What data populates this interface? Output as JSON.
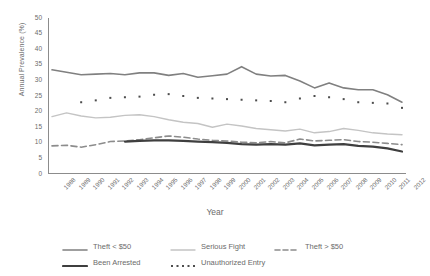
{
  "chart_data": {
    "type": "line",
    "title": "",
    "xlabel": "Year",
    "ylabel": "Annual Prevalence (%)",
    "ylim": [
      0,
      50
    ],
    "yticks": [
      0,
      5,
      10,
      15,
      20,
      25,
      30,
      35,
      40,
      45,
      50
    ],
    "grid": false,
    "legend_position": "bottom",
    "categories": [
      1988,
      1989,
      1990,
      1991,
      1992,
      1993,
      1994,
      1995,
      1996,
      1997,
      1998,
      1999,
      2000,
      2001,
      2002,
      2003,
      2004,
      2005,
      2006,
      2007,
      2008,
      2009,
      2010,
      2011,
      2012
    ],
    "x": [
      "1988",
      "1989",
      "1990",
      "1991",
      "1992",
      "1993",
      "1994",
      "1995",
      "1996",
      "1997",
      "1998",
      "1999",
      "2000",
      "2001",
      "2002",
      "2003",
      "2004",
      "2005",
      "2006",
      "2007",
      "2008",
      "2009",
      "2010",
      "2011",
      "2012"
    ],
    "series": [
      {
        "name": "Theft < $50",
        "color": "#808080",
        "style": "solid",
        "width": 1.6,
        "values": [
          33.4,
          32.6,
          31.8,
          32.0,
          32.2,
          31.8,
          32.4,
          32.4,
          31.6,
          32.2,
          31.0,
          31.5,
          32.0,
          34.4,
          32.0,
          31.4,
          31.6,
          29.8,
          27.6,
          29.2,
          27.6,
          27.0,
          27.0,
          25.4,
          23.0
        ]
      },
      {
        "name": "Serious Fight",
        "color": "#c4c4c4",
        "style": "solid",
        "width": 1.4,
        "values": [
          18.4,
          19.6,
          18.6,
          18.0,
          18.2,
          18.8,
          19.0,
          18.4,
          17.4,
          16.6,
          16.2,
          15.0,
          16.0,
          15.4,
          14.6,
          14.2,
          13.8,
          14.4,
          13.2,
          13.6,
          14.6,
          14.0,
          13.2,
          12.8,
          12.6
        ]
      },
      {
        "name": "Theft > $50",
        "color": "#8c8c8c",
        "style": "dashed",
        "width": 1.6,
        "values": [
          9.0,
          9.2,
          8.6,
          9.4,
          10.4,
          10.6,
          11.0,
          11.6,
          12.2,
          11.8,
          11.2,
          10.8,
          10.6,
          10.2,
          10.0,
          10.4,
          10.0,
          11.2,
          10.6,
          10.8,
          11.0,
          10.4,
          10.2,
          9.8,
          9.4
        ]
      },
      {
        "name": "Been Arrested",
        "color": "#3f3f3f",
        "style": "solid",
        "width": 2.2,
        "values": [
          null,
          null,
          null,
          null,
          null,
          10.4,
          10.6,
          10.8,
          10.8,
          10.6,
          10.4,
          10.2,
          10.0,
          9.6,
          9.4,
          9.6,
          9.4,
          9.8,
          9.2,
          9.4,
          9.6,
          9.0,
          8.8,
          8.2,
          7.2
        ]
      },
      {
        "name": "Unauthorized Entry",
        "color": "#4d4d4d",
        "style": "dotted",
        "width": 2.0,
        "values": [
          null,
          null,
          23.0,
          23.6,
          24.4,
          24.6,
          24.8,
          25.4,
          25.6,
          25.0,
          24.4,
          24.2,
          24.0,
          23.8,
          23.6,
          23.4,
          23.0,
          24.2,
          25.0,
          24.6,
          24.0,
          23.0,
          22.8,
          22.6,
          21.2
        ]
      }
    ]
  },
  "legend": {
    "row1": [
      {
        "label": "Theft < $50",
        "key": "line-solid-gray"
      },
      {
        "label": "Serious Fight",
        "key": "line-solid-lightgray"
      },
      {
        "label": "Theft > $50",
        "key": "line-dashed-gray"
      }
    ],
    "row2": [
      {
        "label": "Been Arrested",
        "key": "line-solid-dark"
      },
      {
        "label": "Unauthorized Entry",
        "key": "line-dotted-dark"
      }
    ]
  }
}
